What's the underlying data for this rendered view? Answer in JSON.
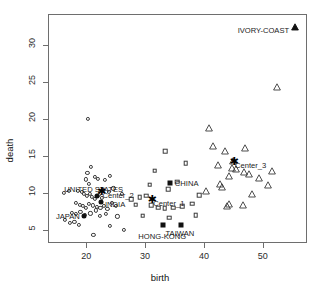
{
  "chart_data": {
    "type": "scatter",
    "title": "",
    "xlabel": "birth",
    "ylabel": "death",
    "xlim": [
      13.5,
      57.5
    ],
    "ylim": [
      3.2,
      34.2
    ],
    "xticks": [
      20,
      30,
      40,
      50
    ],
    "yticks": [
      5,
      10,
      15,
      20,
      25,
      30
    ],
    "grid": false,
    "legend": "none",
    "series": [
      {
        "name": "cluster-1-circles",
        "marker": "circle-open",
        "points": [
          [
            17.0,
            10.2
          ],
          [
            18.6,
            10.3
          ],
          [
            20.2,
            12.7
          ],
          [
            19.9,
            11.8
          ],
          [
            20.5,
            11.2
          ],
          [
            20.8,
            13.5
          ],
          [
            21.4,
            12.2
          ],
          [
            22.0,
            11.9
          ],
          [
            23.2,
            11.7
          ],
          [
            24.0,
            12.3
          ],
          [
            19.2,
            10.1
          ],
          [
            19.6,
            9.9
          ],
          [
            20.1,
            9.6
          ],
          [
            20.6,
            9.8
          ],
          [
            21.0,
            9.4
          ],
          [
            21.5,
            9.2
          ],
          [
            22.1,
            9.7
          ],
          [
            22.6,
            9.3
          ],
          [
            18.3,
            8.6
          ],
          [
            18.9,
            8.4
          ],
          [
            19.4,
            8.2
          ],
          [
            20.0,
            8.0
          ],
          [
            20.4,
            8.5
          ],
          [
            21.1,
            8.3
          ],
          [
            21.8,
            8.1
          ],
          [
            22.4,
            7.9
          ],
          [
            23.0,
            8.2
          ],
          [
            23.6,
            7.8
          ],
          [
            24.3,
            8.6
          ],
          [
            25.1,
            8.2
          ],
          [
            17.6,
            7.3
          ],
          [
            18.2,
            7.1
          ],
          [
            19.0,
            7.4
          ],
          [
            19.8,
            7.0
          ],
          [
            20.7,
            7.2
          ],
          [
            21.6,
            7.6
          ],
          [
            22.3,
            6.9
          ],
          [
            23.4,
            7.1
          ],
          [
            16.4,
            6.3
          ],
          [
            17.2,
            5.9
          ],
          [
            18.0,
            6.1
          ],
          [
            18.8,
            5.7
          ],
          [
            24.0,
            5.5
          ],
          [
            26.4,
            5.0
          ],
          [
            21.2,
            4.3
          ],
          [
            20.3,
            20.0
          ],
          [
            16.2,
            10.0
          ],
          [
            26.0,
            9.8
          ],
          [
            25.3,
            6.8
          ],
          [
            24.6,
            10.6
          ],
          [
            23.8,
            10.1
          ],
          [
            22.8,
            10.4
          ]
        ]
      },
      {
        "name": "cluster-2-squares",
        "marker": "square-open",
        "points": [
          [
            31.6,
            13.0
          ],
          [
            33.4,
            15.6
          ],
          [
            33.9,
            10.5
          ],
          [
            30.2,
            9.6
          ],
          [
            31.0,
            8.3
          ],
          [
            32.2,
            8.0
          ],
          [
            33.3,
            7.9
          ],
          [
            34.8,
            8.0
          ],
          [
            29.6,
            6.9
          ],
          [
            35.4,
            11.5
          ],
          [
            36.3,
            8.2
          ],
          [
            38.0,
            8.5
          ],
          [
            38.6,
            7.0
          ],
          [
            36.9,
            14.0
          ],
          [
            28.4,
            8.4
          ],
          [
            29.1,
            9.4
          ],
          [
            34.1,
            6.6
          ],
          [
            30.8,
            11.1
          ],
          [
            27.6,
            9.1
          ],
          [
            39.2,
            9.7
          ]
        ]
      },
      {
        "name": "cluster-3-triangles",
        "marker": "triangle-open",
        "points": [
          [
            40.9,
            19.6
          ],
          [
            43.5,
            16.4
          ],
          [
            45.0,
            15.1
          ],
          [
            46.8,
            13.6
          ],
          [
            44.3,
            13.1
          ],
          [
            47.6,
            13.3
          ],
          [
            49.4,
            12.8
          ],
          [
            43.0,
            11.6
          ],
          [
            42.8,
            12.0
          ],
          [
            44.7,
            14.2
          ],
          [
            45.4,
            14.0
          ],
          [
            48.2,
            10.6
          ],
          [
            50.8,
            11.9
          ],
          [
            44.2,
            9.3
          ],
          [
            43.9,
            9.0
          ],
          [
            46.6,
            9.1
          ],
          [
            52.4,
            25.1
          ],
          [
            41.6,
            17.2
          ],
          [
            42.4,
            14.6
          ],
          [
            47.0,
            16.9
          ],
          [
            40.3,
            11.0
          ],
          [
            51.6,
            13.8
          ]
        ]
      }
    ],
    "highlighted": [
      {
        "label": "IVORY-COAST",
        "x": 55.4,
        "y": 33.2,
        "marker": "triangle-filled",
        "label_dx": -6,
        "label_dy": 10,
        "anchor": "end"
      },
      {
        "label": "UNITED STATES",
        "x": 21.8,
        "y": 9.6,
        "marker": "circle-filled",
        "label_dx": -3,
        "label_dy": -6,
        "anchor": "middle"
      },
      {
        "label": "JAPAN",
        "x": 19.6,
        "y": 6.9,
        "marker": "circle-filled",
        "label_dx": -4,
        "label_dy": 1,
        "anchor": "end"
      },
      {
        "label": "INDIA",
        "x": 22.5,
        "y": 8.7,
        "marker": "circle-filled",
        "label_dx": 4,
        "label_dy": 3,
        "anchor": "start"
      },
      {
        "label": "CHINA",
        "x": 34.2,
        "y": 11.3,
        "marker": "square-filled",
        "label_dx": 5,
        "label_dy": 1,
        "anchor": "start"
      },
      {
        "label": "TAIWAN",
        "x": 36.1,
        "y": 5.6,
        "marker": "square-filled",
        "label_dx": -1,
        "label_dy": 9,
        "anchor": "middle"
      },
      {
        "label": "HONG-KONG",
        "x": 33.1,
        "y": 5.6,
        "marker": "square-filled",
        "label_dx": -1,
        "label_dy": 12,
        "anchor": "middle"
      }
    ],
    "centers": [
      {
        "label": "Center_1",
        "x": 31.2,
        "y": 9.1,
        "marker": "star"
      },
      {
        "label": "Center_2",
        "x": 22.6,
        "y": 10.2,
        "marker": "star"
      },
      {
        "label": "Center_3",
        "x": 45.1,
        "y": 14.3,
        "marker": "star"
      }
    ]
  },
  "axes": {
    "x": {
      "label": "birth",
      "ticks": [
        "20",
        "30",
        "40",
        "50"
      ]
    },
    "y": {
      "label": "death",
      "ticks": [
        "5",
        "10",
        "15",
        "20",
        "25",
        "30"
      ]
    }
  },
  "colors": {
    "frame": "#6e6e6e",
    "marker_outline": "#3a3a3a",
    "marker_fill": "#111111",
    "text": "#1a1a1a",
    "background": "#ffffff"
  }
}
